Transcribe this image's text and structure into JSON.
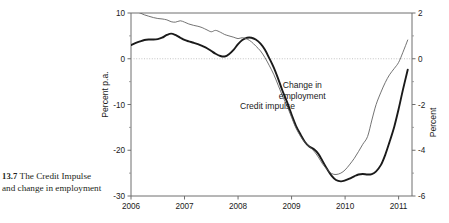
{
  "caption": {
    "figure_number": "13.7",
    "text": "The Credit Impulse and change in employment"
  },
  "colors": {
    "credit_impulse": "#1a1a1a",
    "change_in_employment": "#5a5a5a",
    "axis": "#6e6e6e",
    "zero_line": "#b5b5b5",
    "background": "#ffffff"
  },
  "chart_data": {
    "type": "line",
    "title": "",
    "subtitle": "",
    "xlabel": "",
    "ylabel": "Percent p.a.",
    "y2label": "Percent",
    "xlim": [
      2006.0,
      2011.25
    ],
    "ylim": [
      -30,
      10
    ],
    "y2lim": [
      -6,
      2
    ],
    "grid": false,
    "zero_line": true,
    "legend_position": "inline-annotations",
    "x_ticks": [
      "2006",
      "2007",
      "2008",
      "2009",
      "2010",
      "2011"
    ],
    "x_tick_values": [
      2006,
      2007,
      2008,
      2009,
      2010,
      2011
    ],
    "y_ticks": [
      "10",
      "0",
      "-10",
      "-20",
      "-30"
    ],
    "y_tick_values": [
      10,
      0,
      -10,
      -20,
      -30
    ],
    "y2_ticks": [
      "2",
      "0",
      "-2",
      "-4",
      "-6"
    ],
    "y2_tick_values": [
      2,
      0,
      -2,
      -4,
      -6
    ],
    "annotations": [
      {
        "label": "Credit impulse",
        "x": 2008.55,
        "y": -11.0
      },
      {
        "label": "Change in employment",
        "x": 2009.2,
        "y": -6.5
      }
    ],
    "series": [
      {
        "name": "Credit impulse",
        "axis": "left",
        "unit": "Percent p.a.",
        "style": "thick",
        "x": [
          2006.0,
          2006.08,
          2006.17,
          2006.25,
          2006.33,
          2006.42,
          2006.5,
          2006.58,
          2006.67,
          2006.75,
          2006.83,
          2006.92,
          2007.0,
          2007.08,
          2007.17,
          2007.25,
          2007.33,
          2007.42,
          2007.5,
          2007.58,
          2007.67,
          2007.75,
          2007.83,
          2007.92,
          2008.0,
          2008.08,
          2008.17,
          2008.25,
          2008.33,
          2008.42,
          2008.5,
          2008.58,
          2008.67,
          2008.75,
          2008.83,
          2008.92,
          2009.0,
          2009.08,
          2009.17,
          2009.25,
          2009.33,
          2009.42,
          2009.5,
          2009.58,
          2009.67,
          2009.75,
          2009.83,
          2009.92,
          2010.0,
          2010.08,
          2010.17,
          2010.25,
          2010.33,
          2010.42,
          2010.5,
          2010.58,
          2010.67,
          2010.75,
          2010.83,
          2010.92,
          2011.0,
          2011.08,
          2011.17
        ],
        "values": [
          3.0,
          3.4,
          3.8,
          4.1,
          4.2,
          4.2,
          4.3,
          4.6,
          5.2,
          5.5,
          5.2,
          4.6,
          4.1,
          3.8,
          3.5,
          3.2,
          2.8,
          2.3,
          1.7,
          1.1,
          0.6,
          0.5,
          1.0,
          2.0,
          3.2,
          4.1,
          4.6,
          4.6,
          4.2,
          3.3,
          2.0,
          0.2,
          -2.0,
          -4.4,
          -7.0,
          -9.6,
          -12.2,
          -14.6,
          -16.6,
          -18.2,
          -19.2,
          -19.8,
          -20.8,
          -22.4,
          -24.2,
          -25.6,
          -26.5,
          -26.8,
          -26.6,
          -26.2,
          -25.7,
          -25.3,
          -25.2,
          -25.3,
          -25.2,
          -24.6,
          -23.2,
          -21.0,
          -18.2,
          -14.8,
          -11.0,
          -6.8,
          -2.4
        ]
      },
      {
        "name": "Change in employment",
        "axis": "right",
        "unit": "Percent",
        "style": "thin",
        "x": [
          2006.0,
          2006.08,
          2006.17,
          2006.25,
          2006.33,
          2006.42,
          2006.5,
          2006.58,
          2006.67,
          2006.75,
          2006.83,
          2006.92,
          2007.0,
          2007.08,
          2007.17,
          2007.25,
          2007.33,
          2007.42,
          2007.5,
          2007.58,
          2007.67,
          2007.75,
          2007.83,
          2007.92,
          2008.0,
          2008.08,
          2008.17,
          2008.25,
          2008.33,
          2008.42,
          2008.5,
          2008.58,
          2008.67,
          2008.75,
          2008.83,
          2008.92,
          2009.0,
          2009.08,
          2009.17,
          2009.25,
          2009.33,
          2009.42,
          2009.5,
          2009.58,
          2009.67,
          2009.75,
          2009.83,
          2009.92,
          2010.0,
          2010.08,
          2010.17,
          2010.25,
          2010.33,
          2010.42,
          2010.5,
          2010.58,
          2010.67,
          2010.75,
          2010.83,
          2010.92,
          2011.0,
          2011.08,
          2011.17
        ],
        "values": [
          2.15,
          2.08,
          2.0,
          1.92,
          1.86,
          1.8,
          1.76,
          1.74,
          1.7,
          1.62,
          1.6,
          1.66,
          1.6,
          1.52,
          1.46,
          1.42,
          1.36,
          1.26,
          1.18,
          1.24,
          1.16,
          1.06,
          1.0,
          0.94,
          0.88,
          0.92,
          0.86,
          0.74,
          0.56,
          0.34,
          0.06,
          -0.28,
          -0.7,
          -1.16,
          -1.62,
          -2.08,
          -2.56,
          -3.02,
          -3.4,
          -3.66,
          -3.84,
          -4.04,
          -4.3,
          -4.6,
          -4.86,
          -5.02,
          -5.06,
          -5.0,
          -4.86,
          -4.64,
          -4.36,
          -4.06,
          -3.74,
          -3.4,
          -2.68,
          -2.0,
          -1.46,
          -1.04,
          -0.7,
          -0.42,
          -0.16,
          0.28,
          0.82
        ]
      }
    ]
  },
  "artifact": {
    "top_right_fragment": ""
  }
}
